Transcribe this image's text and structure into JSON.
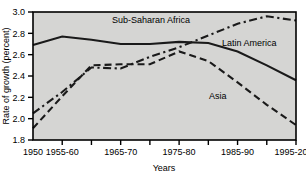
{
  "chart_data": {
    "type": "line",
    "title": "",
    "xlabel": "Years",
    "ylabel": "Rate of growth (percent)",
    "ylim": [
      1.8,
      3.0
    ],
    "y_ticks": [
      1.8,
      2.0,
      2.2,
      2.4,
      2.6,
      2.8,
      3.0
    ],
    "y_tick_labels": [
      "1.8",
      "2.0",
      "2.2",
      "2.4",
      "2.6",
      "2.8",
      "3.0"
    ],
    "grid": false,
    "legend_position": "inline-annotations",
    "x": [
      "1950-55",
      "1955-60",
      "1960-65",
      "1965-70",
      "1970-75",
      "1975-80",
      "1980-85",
      "1985-90",
      "1990-95",
      "1995-2000"
    ],
    "x_tick_labels": [
      "1950",
      "1955-60",
      "1965-70",
      "1975-80",
      "1985-90",
      "1995-2000"
    ],
    "x_tick_label_positions": [
      0,
      1,
      3,
      5,
      7,
      9
    ],
    "series": [
      {
        "name": "Latin America",
        "style": "solid",
        "values": [
          2.69,
          2.77,
          2.74,
          2.7,
          2.7,
          2.72,
          2.71,
          2.63,
          2.5,
          2.36
        ]
      },
      {
        "name": "Asia",
        "style": "dashed",
        "values": [
          1.91,
          2.21,
          2.5,
          2.51,
          2.51,
          2.63,
          2.54,
          2.34,
          2.13,
          1.94
        ]
      },
      {
        "name": "Sub-Saharan Africa",
        "style": "dashdot",
        "values": [
          2.05,
          2.25,
          2.48,
          2.47,
          2.58,
          2.67,
          2.78,
          2.89,
          2.96,
          2.92
        ]
      }
    ]
  },
  "annotations": {
    "sub_saharan_africa": "Sub-Saharan Africa",
    "latin_america": "Latin America",
    "asia": "Asia"
  }
}
